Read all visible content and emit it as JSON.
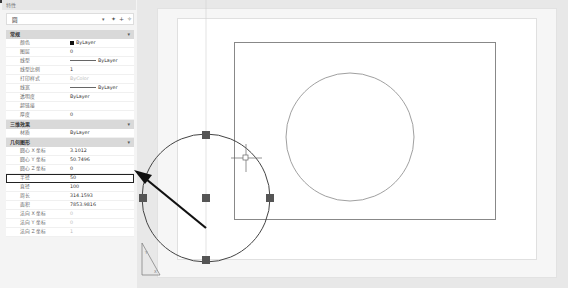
{
  "panel": {
    "title": "特性",
    "selector_value": "圆",
    "toolbar_icons": [
      "quick-select-icon",
      "select-objects-icon",
      "toggle-pickadd-icon"
    ],
    "sections": [
      {
        "name": "常规",
        "rows": [
          {
            "key": "颜色",
            "value": "ByLayer",
            "type": "color"
          },
          {
            "key": "图层",
            "value": "0"
          },
          {
            "key": "线型",
            "value": "ByLayer",
            "type": "line"
          },
          {
            "key": "线型比例",
            "value": "1"
          },
          {
            "key": "打印样式",
            "value": "ByColor",
            "dim": true
          },
          {
            "key": "线宽",
            "value": "ByLayer",
            "type": "line"
          },
          {
            "key": "透明度",
            "value": "ByLayer"
          },
          {
            "key": "超链接",
            "value": ""
          },
          {
            "key": "厚度",
            "value": "0"
          }
        ]
      },
      {
        "name": "三维效果",
        "rows": [
          {
            "key": "材质",
            "value": "ByLayer"
          }
        ]
      },
      {
        "name": "几何图形",
        "rows": [
          {
            "key": "圆心 X 坐标",
            "value": "3.1012"
          },
          {
            "key": "圆心 Y 坐标",
            "value": "50.7496"
          },
          {
            "key": "圆心 Z 坐标",
            "value": "0"
          },
          {
            "key": "半径",
            "value": "50",
            "highlight": true
          },
          {
            "key": "直径",
            "value": "100"
          },
          {
            "key": "周长",
            "value": "314.1593"
          },
          {
            "key": "面积",
            "value": "7853.9816"
          },
          {
            "key": "法向 X 坐标",
            "value": "0",
            "dim": true
          },
          {
            "key": "法向 Y 坐标",
            "value": "0",
            "dim": true
          },
          {
            "key": "法向 Z 坐标",
            "value": "1",
            "dim": true
          }
        ]
      }
    ]
  },
  "canvas": {
    "selected_circle": {
      "cx": 206,
      "cy": 198,
      "r": 64,
      "grips": 5
    },
    "other_circle": {
      "cx": 350,
      "cy": 137,
      "r": 64
    },
    "annotation_arrow": {
      "from": [
        207,
        230
      ],
      "to": [
        135,
        173
      ],
      "color": "#111111"
    },
    "ucs_icon": "ucs-triangle-icon"
  },
  "colors": {
    "grip": "#555555",
    "highlight_border": "#222222",
    "section_bg": "#d9d9d9"
  }
}
